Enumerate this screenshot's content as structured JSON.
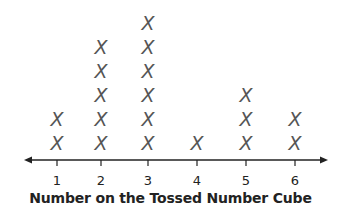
{
  "chart_data": {
    "type": "scatter",
    "subtype": "line-plot (dot plot with X marks)",
    "title": "",
    "xlabel": "Number on the Tossed Number Cube",
    "ylabel": "",
    "categories": [
      "1",
      "2",
      "3",
      "4",
      "5",
      "6"
    ],
    "values": [
      2,
      5,
      6,
      1,
      3,
      2
    ],
    "marker": "X",
    "grid": false,
    "legend": null,
    "axis_arrows": "both ends"
  },
  "style": {
    "mark_color": "#555555",
    "axis_color": "#222222"
  }
}
